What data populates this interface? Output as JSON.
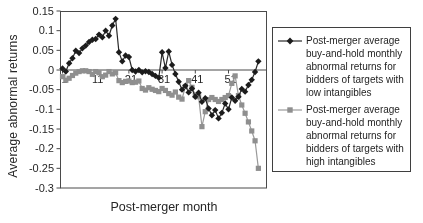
{
  "chart_data": {
    "type": "line",
    "title": "",
    "xlabel": "Post-merger month",
    "ylabel": "Average abnormal returns",
    "x": [
      1,
      2,
      3,
      4,
      5,
      6,
      7,
      8,
      9,
      10,
      11,
      12,
      13,
      14,
      15,
      16,
      17,
      18,
      19,
      20,
      21,
      22,
      23,
      24,
      25,
      26,
      27,
      28,
      29,
      30,
      31,
      32,
      33,
      34,
      35,
      36,
      37,
      38,
      39,
      40,
      41,
      42,
      43,
      44,
      45,
      46,
      47,
      48,
      49,
      50,
      51,
      52,
      53,
      54,
      55,
      56,
      57,
      58,
      59,
      60
    ],
    "x_tick_months": [
      1,
      11,
      21,
      31,
      41,
      51
    ],
    "ylim": [
      -0.3,
      0.15
    ],
    "y_ticks": [
      0.15,
      0.1,
      0.05,
      0,
      -0.05,
      -0.1,
      -0.15,
      -0.2,
      -0.25,
      -0.3
    ],
    "y_tick_labels": [
      "0.15",
      "0.1",
      "0.05",
      "0",
      "-0.05",
      "-0.1",
      "-0.15",
      "-0.2",
      "-0.25",
      "-0.3"
    ],
    "grid": false,
    "legend_position": "right",
    "series": [
      {
        "name": "Post-merger average buy-and-hold monthly abnormal returns for bidders of targets with low intangibles",
        "marker": "diamond",
        "color": "#1c1c1c",
        "line_color": "#2a2a2a",
        "values": [
          0.004,
          -0.004,
          0.017,
          0.03,
          0.049,
          0.043,
          0.055,
          0.062,
          0.071,
          0.077,
          0.079,
          0.09,
          0.083,
          0.1,
          0.087,
          0.113,
          0.13,
          0.045,
          0.022,
          0.037,
          0.033,
          0,
          -0.004,
          0,
          -0.006,
          -0.003,
          -0.005,
          -0.01,
          -0.015,
          -0.02,
          0.045,
          0.005,
          0.047,
          0.013,
          -0.01,
          -0.03,
          -0.05,
          -0.04,
          -0.057,
          -0.047,
          -0.068,
          -0.058,
          -0.081,
          -0.072,
          -0.098,
          -0.115,
          -0.102,
          -0.123,
          -0.109,
          -0.085,
          -0.1,
          -0.07,
          -0.078,
          -0.068,
          -0.048,
          -0.055,
          -0.038,
          -0.025,
          -0.005,
          0.022
        ]
      },
      {
        "name": "Post-merger average buy-and-hold monthly abnormal returns for bidders of targets with high intangibles",
        "marker": "square",
        "color": "#8f8f8f",
        "line_color": "#9a9a9a",
        "values": [
          -0.017,
          -0.026,
          -0.021,
          -0.014,
          -0.008,
          -0.004,
          -0.002,
          -0.002,
          -0.004,
          -0.011,
          -0.004,
          -0.007,
          -0.017,
          -0.013,
          -0.004,
          -0.01,
          -0.007,
          -0.027,
          -0.032,
          -0.029,
          -0.028,
          -0.032,
          -0.031,
          -0.028,
          -0.047,
          -0.051,
          -0.045,
          -0.049,
          -0.052,
          -0.055,
          -0.047,
          -0.052,
          -0.06,
          -0.064,
          -0.056,
          -0.069,
          -0.074,
          -0.042,
          -0.027,
          -0.044,
          -0.064,
          -0.068,
          -0.144,
          -0.106,
          -0.075,
          -0.07,
          -0.075,
          -0.08,
          -0.075,
          -0.07,
          -0.065,
          -0.034,
          -0.015,
          -0.065,
          -0.089,
          -0.11,
          -0.132,
          -0.155,
          -0.18,
          -0.25
        ]
      }
    ],
    "axis_color": "#4a4a4a"
  }
}
